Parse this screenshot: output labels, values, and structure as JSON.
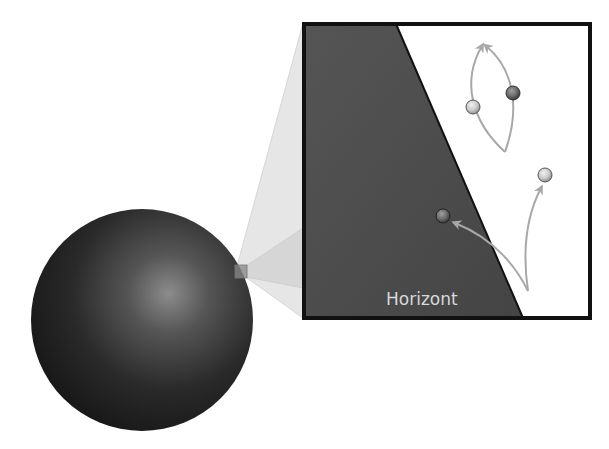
{
  "diagram": {
    "title": "",
    "inset": {
      "horizon_label": "Horizont"
    },
    "elements": {
      "large_sphere": "black-hole-sphere",
      "zoom_square": "zoom-region-marker",
      "zoom_inset": "magnified-horizon-view",
      "particles": [
        {
          "name": "particle-inside-horizon",
          "side": "inside"
        },
        {
          "name": "particle-escaping",
          "side": "outside"
        },
        {
          "name": "particle-pair-left",
          "side": "outside"
        },
        {
          "name": "particle-pair-right",
          "side": "outside"
        }
      ],
      "arrows": [
        "arrow-into-horizon",
        "arrow-escaping",
        "arrow-pair-loop-left",
        "arrow-pair-loop-right"
      ]
    },
    "colors": {
      "sphere_dark": "#1a1a1a",
      "sphere_highlight": "#8a8a8a",
      "horizon_region": "#4a4a4a",
      "border": "#111111",
      "arrow": "#a8a8a8",
      "cone": "#e2e2e2",
      "label": "#d8d8d8"
    }
  }
}
